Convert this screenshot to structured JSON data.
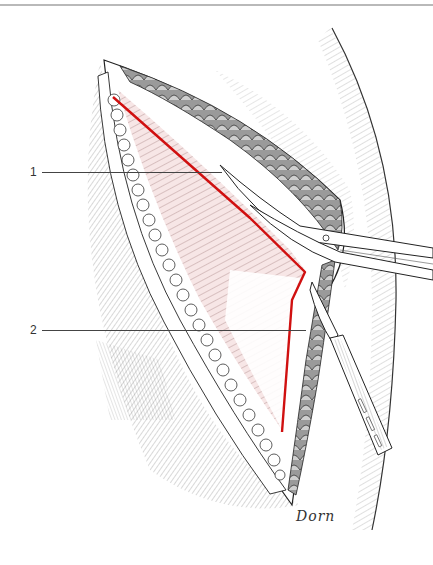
{
  "figure": {
    "type": "surgical-illustration",
    "labels": [
      {
        "id": "1",
        "text": "1",
        "x": 30,
        "y": 166,
        "leader_start": 42,
        "leader_end": 222,
        "leader_y": 172
      },
      {
        "id": "2",
        "text": "2",
        "x": 30,
        "y": 324,
        "leader_start": 42,
        "leader_end": 306,
        "leader_y": 330
      }
    ],
    "signature": "Dorn",
    "colors": {
      "incision_line": "#d01010",
      "ink": "#222222",
      "muscle_tint": "#f3d9d9",
      "rule": "#b9b9b9"
    },
    "instruments": [
      "scissors",
      "scalpel"
    ]
  }
}
